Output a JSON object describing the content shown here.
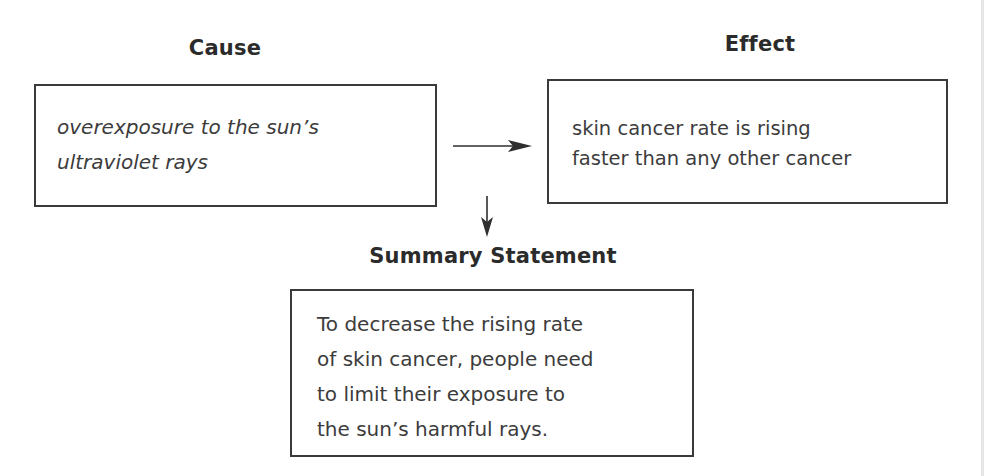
{
  "diagram": {
    "cause": {
      "heading": "Cause",
      "lines": [
        "overexposure to the sun’s",
        "ultraviolet rays"
      ]
    },
    "effect": {
      "heading": "Effect",
      "lines": [
        "skin cancer rate is rising",
        "faster than any other cancer"
      ]
    },
    "summary": {
      "heading": "Summary Statement",
      "lines": [
        "To decrease the rising rate",
        "of skin cancer, people need",
        "to limit their exposure to",
        "the sun’s harmful rays."
      ]
    },
    "arrows": [
      {
        "name": "cause-to-effect",
        "direction": "right"
      },
      {
        "name": "to-summary",
        "direction": "down"
      }
    ],
    "colors": {
      "border": "#3a3a3a",
      "heading_text": "#2b2b2b",
      "body_text": "#3c3c3c",
      "background": "#ffffff"
    }
  }
}
